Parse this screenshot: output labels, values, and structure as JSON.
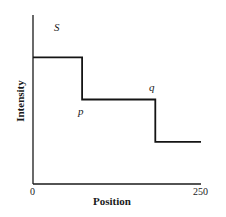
{
  "chart_data": {
    "type": "line",
    "title": "",
    "xlabel": "Position",
    "ylabel": "Intensity",
    "xlim": [
      0,
      250
    ],
    "ylim": [
      0,
      4
    ],
    "x_ticks": [
      "0",
      "250"
    ],
    "y_ticks": [],
    "grid": false,
    "legend": null,
    "step": true,
    "series": [
      {
        "name": "Intensity profile",
        "x": [
          0,
          73,
          73,
          182,
          182,
          250
        ],
        "y": [
          3,
          3,
          2,
          2,
          1,
          1
        ]
      }
    ],
    "annotations": [
      {
        "text": "S",
        "x": 30,
        "y": 3.8
      },
      {
        "text": "p",
        "x": 70,
        "y": 1.7
      },
      {
        "text": "q",
        "x": 172,
        "y": 2.3
      }
    ]
  },
  "labels": {
    "x_tick_0": "0",
    "x_tick_250": "250",
    "xlabel": "Position",
    "ylabel": "Intensity",
    "ann_s": "S",
    "ann_p": "p",
    "ann_q": "q"
  }
}
